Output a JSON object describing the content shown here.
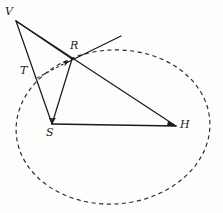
{
  "figure": {
    "canvas": {
      "width": 223,
      "height": 213
    },
    "background_color": "#fdfdfc",
    "ink_color": "#1b1b1b",
    "points": [
      {
        "id": "V",
        "label": "V",
        "x": 16,
        "y": 21,
        "label_x": 6,
        "label_y": 7
      },
      {
        "id": "T",
        "label": "T",
        "x": 31,
        "y": 72,
        "label_x": 20,
        "label_y": 66
      },
      {
        "id": "R",
        "label": "R",
        "x": 72,
        "y": 59,
        "label_x": 70,
        "label_y": 41
      },
      {
        "id": "S",
        "label": "S",
        "x": 52,
        "y": 124,
        "label_x": 46,
        "label_y": 127
      },
      {
        "id": "H",
        "label": "H",
        "x": 176,
        "y": 126,
        "label_x": 180,
        "label_y": 120
      }
    ],
    "segments": [
      {
        "id": "V-H",
        "from": "V",
        "to": "H",
        "style": "solid",
        "note": "long line from V through R to H"
      },
      {
        "id": "V-S",
        "from": "V",
        "to": "S",
        "style": "solid",
        "note": "line from V through T down to S"
      },
      {
        "id": "V-R",
        "from": "V",
        "to": "R",
        "style": "solid"
      },
      {
        "id": "R-S",
        "from": "R",
        "to": "S",
        "style": "solid"
      },
      {
        "id": "S-H",
        "from": "S",
        "to": "H",
        "style": "solid"
      },
      {
        "id": "R-ray",
        "from": "R",
        "to": "ray-end",
        "style": "solid",
        "note": "tangent ray extending up-right from R"
      },
      {
        "id": "T-R-dash",
        "from": "T",
        "to": "R",
        "style": "dashed",
        "arrow": "end",
        "note": "dashed arrow from below T pointing to R"
      }
    ],
    "ray_end": {
      "x": 121,
      "y": 36
    },
    "dash_arrow": {
      "x1": 37,
      "y1": 77,
      "x2": 71,
      "y2": 60
    },
    "ellipse": {
      "id": "dashed-ellipse",
      "cx": 113,
      "cy": 127,
      "rx": 97,
      "ry": 77,
      "rotation_deg": -4,
      "style": "dashed",
      "stroke_width": 1.1,
      "dash_pattern": "4 3"
    }
  }
}
